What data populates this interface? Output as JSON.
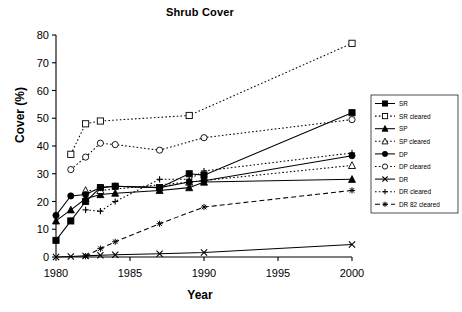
{
  "chart_data": {
    "type": "line",
    "title": "Shrub Cover",
    "xlabel": "Year",
    "ylabel": "Cover (%)",
    "xlim": [
      1980,
      2000
    ],
    "ylim": [
      0,
      80
    ],
    "xticks": [
      1980,
      1985,
      1990,
      1995,
      2000
    ],
    "yticks": [
      0,
      10,
      20,
      30,
      40,
      50,
      60,
      70,
      80
    ],
    "grid": false,
    "legend_position": "right",
    "series": [
      {
        "name": "SR",
        "marker": "filled-square",
        "line": "solid",
        "x": [
          1980,
          1981,
          1982,
          1983,
          1984,
          1987,
          1989,
          1990,
          2000
        ],
        "y": [
          6,
          13,
          20,
          25,
          25.5,
          25,
          30,
          29.5,
          52
        ]
      },
      {
        "name": "SR cleared",
        "marker": "open-square",
        "line": "dotted",
        "x": [
          1981,
          1982,
          1983,
          1989,
          2000
        ],
        "y": [
          37,
          48,
          49,
          51,
          77
        ]
      },
      {
        "name": "SP",
        "marker": "filled-triangle",
        "line": "solid",
        "x": [
          1980,
          1981,
          1982,
          1983,
          1984,
          1987,
          1989,
          1990,
          2000
        ],
        "y": [
          13,
          17,
          21,
          22.5,
          23,
          24,
          25,
          27,
          28
        ]
      },
      {
        "name": "SP cleared",
        "marker": "open-triangle",
        "line": "dotted",
        "x": [
          1982,
          1983,
          1989,
          2000
        ],
        "y": [
          24,
          24,
          27,
          33
        ]
      },
      {
        "name": "DP",
        "marker": "filled-circle",
        "line": "solid",
        "x": [
          1980,
          1981,
          1982,
          1983,
          1984,
          1987,
          1989,
          1990,
          2000
        ],
        "y": [
          15,
          22,
          22.5,
          25,
          25.5,
          25,
          27,
          27.5,
          36.5
        ]
      },
      {
        "name": "DP cleared",
        "marker": "open-circle",
        "line": "dotted",
        "x": [
          1981,
          1982,
          1983,
          1984,
          1987,
          1990,
          2000
        ],
        "y": [
          31.5,
          36,
          41,
          40.5,
          38.5,
          43,
          49.5
        ]
      },
      {
        "name": "DR",
        "marker": "x-cross",
        "line": "solid",
        "x": [
          1980,
          1981,
          1982,
          1983,
          1984,
          1987,
          1990,
          2000
        ],
        "y": [
          0,
          0.2,
          0.4,
          0.6,
          0.8,
          1.2,
          1.6,
          4.5
        ]
      },
      {
        "name": "DR cleared",
        "marker": "plus",
        "line": "dotted",
        "x": [
          1982,
          1983,
          1984,
          1987,
          1989,
          1990,
          2000
        ],
        "y": [
          17,
          16.5,
          20,
          28,
          28,
          31,
          37.5
        ]
      },
      {
        "name": "DR 82 cleared",
        "marker": "asterisk",
        "line": "dashed",
        "x": [
          1982,
          1983,
          1984,
          1987,
          1990,
          2000
        ],
        "y": [
          0.3,
          3,
          5.5,
          12,
          18,
          24
        ]
      }
    ]
  },
  "legend": {
    "entries": [
      {
        "label": "SR"
      },
      {
        "label": "SR cleared"
      },
      {
        "label": "SP"
      },
      {
        "label": "SP cleared"
      },
      {
        "label": "DP"
      },
      {
        "label": "DP cleared"
      },
      {
        "label": "DR"
      },
      {
        "label": "DR cleared"
      },
      {
        "label": "DR 82 cleared"
      }
    ]
  },
  "colors": {
    "axis": "#000000",
    "series": "#000000",
    "background": "#ffffff"
  }
}
